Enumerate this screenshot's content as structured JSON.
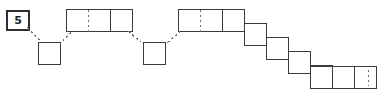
{
  "diagram": {
    "type": "grid-polyomino-path-puzzle",
    "background": "#ffffff",
    "stroke_color": "#3a3a40",
    "dashed_color": "#6d6d75",
    "label_box": {
      "name": "problem-number",
      "text": "5",
      "x": 6,
      "y": 10,
      "w": 20,
      "h": 17
    },
    "cell_size": 22,
    "shapes": [
      {
        "id": "strip-top-left",
        "kind": "horizontal-strip",
        "x": 66,
        "y": 9,
        "cells": 3,
        "dividers": [
          {
            "after_cell": 1,
            "style": "dashed"
          },
          {
            "after_cell": 2,
            "style": "solid"
          }
        ]
      },
      {
        "id": "single-box-left",
        "kind": "single-square",
        "x": 38,
        "y": 42,
        "cells": 1
      },
      {
        "id": "single-box-mid",
        "kind": "single-square",
        "x": 143,
        "y": 42,
        "cells": 1
      },
      {
        "id": "strip-top-right",
        "kind": "horizontal-strip",
        "x": 178,
        "y": 9,
        "cells": 2,
        "dividers": [
          {
            "after_cell": 1,
            "style": "dashed"
          }
        ]
      },
      {
        "id": "staircase",
        "kind": "descending-staircase",
        "start_x": 222,
        "start_y": 9,
        "steps": 5,
        "step_dx": 22,
        "step_dy": 14
      },
      {
        "id": "strip-bottom-right",
        "kind": "horizontal-strip",
        "x": 310,
        "y": 66,
        "cells": 3,
        "dividers": [
          {
            "after_cell": 1,
            "style": "solid"
          },
          {
            "after_cell": 2,
            "style": "solid"
          },
          {
            "after_cell": 3,
            "style": "dashed"
          }
        ]
      }
    ],
    "connectors": [
      {
        "id": "conn-label-to-box",
        "from": "label-box",
        "to": "single-box-left",
        "x1": 27,
        "y1": 27,
        "x2": 40,
        "y2": 41,
        "style": "dashed"
      },
      {
        "id": "conn-box-to-strip1",
        "from": "single-box-left",
        "to": "strip-top-left",
        "x1": 62,
        "y1": 41,
        "x2": 72,
        "y2": 30,
        "style": "dashed"
      },
      {
        "id": "conn-strip1-to-boxmid",
        "from": "strip-top-left",
        "to": "single-box-mid",
        "x1": 128,
        "y1": 31,
        "x2": 141,
        "y2": 42,
        "style": "dashed"
      },
      {
        "id": "conn-boxmid-to-strip2",
        "from": "single-box-mid",
        "to": "strip-top-right",
        "x1": 167,
        "y1": 42,
        "x2": 180,
        "y2": 31,
        "style": "dashed"
      }
    ]
  }
}
